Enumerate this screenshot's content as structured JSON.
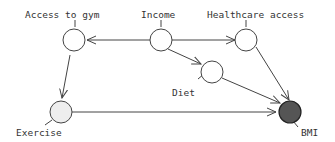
{
  "diagram": {
    "type": "causal-dag",
    "colors": {
      "stroke": "#444444",
      "node_fill": "#ffffff",
      "exercise_fill": "#eeeeee",
      "outcome_fill": "#555555",
      "text": "#333333"
    },
    "nodes": [
      {
        "id": "access_to_gym",
        "label": "Access to gym",
        "fill": "plain"
      },
      {
        "id": "income",
        "label": "Income",
        "fill": "plain"
      },
      {
        "id": "healthcare_access",
        "label": "Healthcare access",
        "fill": "plain"
      },
      {
        "id": "diet",
        "label": "Diet",
        "fill": "plain"
      },
      {
        "id": "exercise",
        "label": "Exercise",
        "fill": "light"
      },
      {
        "id": "bmi",
        "label": "BMI",
        "fill": "dark"
      }
    ],
    "edges": [
      {
        "from": "income",
        "to": "access_to_gym"
      },
      {
        "from": "income",
        "to": "healthcare_access"
      },
      {
        "from": "income",
        "to": "diet"
      },
      {
        "from": "access_to_gym",
        "to": "exercise"
      },
      {
        "from": "exercise",
        "to": "bmi"
      },
      {
        "from": "diet",
        "to": "bmi"
      },
      {
        "from": "healthcare_access",
        "to": "bmi"
      }
    ]
  }
}
